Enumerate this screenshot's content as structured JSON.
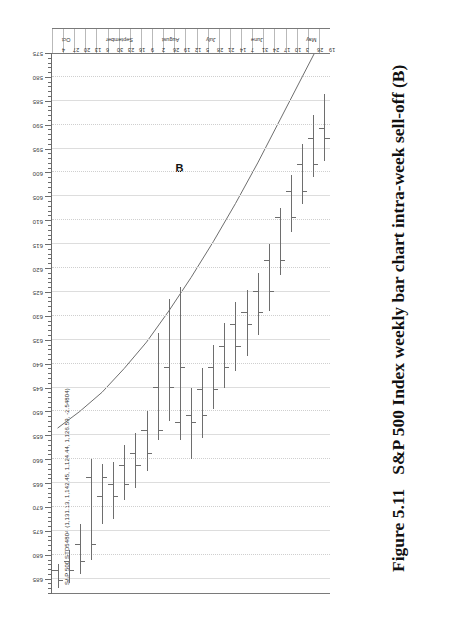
{
  "figure": {
    "caption_number": "Figure 5.11",
    "caption_text": "S&P 500 Index weekly bar chart intra-week sell-off (B)"
  },
  "annotations": [
    {
      "label": "B",
      "x_date": "19 Jul",
      "note": "intra-week sell-off low"
    }
  ],
  "chart_data": {
    "type": "bar",
    "subtype": "ohlc-weekly",
    "title": "S&P 500 STD54804 (1,131.13, 1,142.45, 1,124.44, 1,126.59, -2.54804)",
    "xlabel": "",
    "ylabel": "",
    "orientation": "rotated-90-ccw",
    "grid": true,
    "legend": "none",
    "ylim": [
      575,
      688
    ],
    "ytick_step": 5,
    "yticks": [
      685,
      680,
      675,
      670,
      665,
      660,
      655,
      650,
      645,
      640,
      635,
      630,
      625,
      620,
      615,
      610,
      605,
      600,
      595,
      590,
      585,
      580,
      575
    ],
    "ytick_labels": [
      "685",
      "680",
      "675",
      "670",
      "665",
      "660",
      "655",
      "650",
      "645",
      "640",
      "635",
      "630",
      "625",
      "620",
      "615",
      "610",
      "605",
      "600",
      "595",
      "590",
      "585",
      "580",
      "575"
    ],
    "minor_ticks_per_major": 5,
    "categories": [
      "19",
      "26",
      "3",
      "10",
      "17",
      "24",
      "31",
      "7",
      "14",
      "21",
      "28",
      "5",
      "12",
      "19",
      "26",
      "2",
      "9",
      "16",
      "23",
      "30",
      "6",
      "13",
      "20",
      "27",
      "4"
    ],
    "month_labels": [
      "",
      "",
      "May",
      "",
      "",
      "",
      "",
      "June",
      "",
      "",
      "",
      "July",
      "",
      "",
      "",
      "August",
      "",
      "",
      "",
      "",
      "September",
      "",
      "",
      "",
      "Oct"
    ],
    "series": [
      {
        "name": "S&P 500 weekly OHLC",
        "fields": [
          "open",
          "high",
          "low",
          "close"
        ],
        "values": [
          [
            591.0,
            597.5,
            583.5,
            593.0
          ],
          [
            593.0,
            601.0,
            588.0,
            598.5
          ],
          [
            598.5,
            606.5,
            594.0,
            604.0
          ],
          [
            604.0,
            612.5,
            600.5,
            609.5
          ],
          [
            609.5,
            621.5,
            607.5,
            618.5
          ],
          [
            618.5,
            629.0,
            615.0,
            625.0
          ],
          [
            625.0,
            634.0,
            621.0,
            629.5
          ],
          [
            629.5,
            638.5,
            624.5,
            632.0
          ],
          [
            632.0,
            641.5,
            627.0,
            636.5
          ],
          [
            636.5,
            645.0,
            631.5,
            641.0
          ],
          [
            641.0,
            649.5,
            636.0,
            645.5
          ],
          [
            645.5,
            655.5,
            641.0,
            651.0
          ],
          [
            651.0,
            660.0,
            645.0,
            652.5
          ],
          [
            652.5,
            656.0,
            624.0,
            641.0
          ],
          [
            641.0,
            652.0,
            626.5,
            645.0
          ],
          [
            645.0,
            656.0,
            633.5,
            654.0
          ],
          [
            654.0,
            662.5,
            650.0,
            659.0
          ],
          [
            659.0,
            666.0,
            654.5,
            661.5
          ],
          [
            661.5,
            668.5,
            657.0,
            665.5
          ],
          [
            665.5,
            672.5,
            660.5,
            668.0
          ],
          [
            668.0,
            673.5,
            661.0,
            664.0
          ],
          [
            664.0,
            681.0,
            660.0,
            678.0
          ],
          [
            678.0,
            684.0,
            673.5,
            681.5
          ],
          [
            681.5,
            686.0,
            679.0,
            683.5
          ],
          [
            683.5,
            687.0,
            682.0,
            685.5
          ]
        ]
      }
    ],
    "overlay": {
      "name": "long-term trendline",
      "type": "line",
      "points": [
        [
          0,
          571.0
        ],
        [
          2,
          580.0
        ],
        [
          4,
          589.0
        ],
        [
          6,
          598.0
        ],
        [
          8,
          606.5
        ],
        [
          10,
          614.5
        ],
        [
          12,
          622.0
        ],
        [
          14,
          629.0
        ],
        [
          16,
          635.5
        ],
        [
          18,
          641.0
        ],
        [
          20,
          646.0
        ],
        [
          22,
          650.0
        ],
        [
          24,
          653.5
        ]
      ]
    }
  }
}
